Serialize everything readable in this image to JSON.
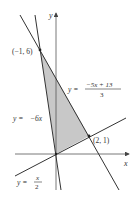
{
  "diagram": {
    "axes": {
      "x_label": "x",
      "y_label": "y"
    },
    "lines": [
      {
        "id": "line-neg6x",
        "label_lhs": "y =",
        "label_rhs": "−6x"
      },
      {
        "id": "line-neg5x13",
        "label_lhs": "y =",
        "label_num": "−5x + 13",
        "label_den": "3"
      },
      {
        "id": "line-half-x",
        "label_lhs": "y =",
        "label_num": "x",
        "label_den": "2"
      }
    ],
    "points": [
      {
        "label": "(−1, 6)",
        "x": -1,
        "y": 6
      },
      {
        "label": "(2, 1)",
        "x": 2,
        "y": 1
      },
      {
        "label": "origin",
        "x": 0,
        "y": 0
      }
    ],
    "region": {
      "description": "Shaded triangle with vertices (0,0), (−1,6), (2,1)",
      "fill": "#c8c8c8"
    },
    "colors": {
      "line": "#333333",
      "axis": "#555555",
      "shade": "#c8c8c8"
    }
  }
}
